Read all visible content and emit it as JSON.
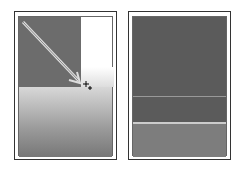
{
  "panels": [
    {
      "name": "before",
      "description": "gradient drag preview"
    },
    {
      "name": "after",
      "description": "filled result"
    }
  ],
  "colors": {
    "dark": "#6c6c6c",
    "result": "#5b5b5b",
    "lower": "#7d7d7d"
  }
}
